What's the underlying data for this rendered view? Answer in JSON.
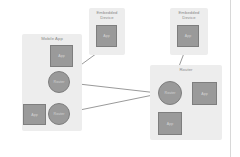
{
  "diagram": {
    "colors": {
      "canvas": "#ffffff",
      "group_fill": "#ededed",
      "node_fill": "#9a9a9a",
      "node_stroke": "#7e7e7e",
      "node_text": "#d5d5d5",
      "group_text": "#8a8a8a",
      "edge": "#9a9a9a",
      "divider": "#d8d8d8"
    },
    "groups": [
      {
        "id": "mobile-app",
        "label": "Mobile App",
        "x": 22,
        "y": 34,
        "w": 60,
        "h": 97
      },
      {
        "id": "embedded-device-top-center",
        "label": "Embedded\nDevice",
        "x": 89,
        "y": 8,
        "w": 36,
        "h": 47
      },
      {
        "id": "embedded-device-top-right",
        "label": "Embedded\nDevice",
        "x": 170,
        "y": 8,
        "w": 38,
        "h": 47
      },
      {
        "id": "router-group",
        "label": "Router",
        "x": 150,
        "y": 65,
        "w": 72,
        "h": 75
      }
    ],
    "nodes": [
      {
        "id": "app-mobile-top",
        "type": "box",
        "label": "App",
        "x": 50,
        "y": 45,
        "w": 23,
        "h": 22
      },
      {
        "id": "router-mobile-1",
        "type": "circle",
        "label": "Router",
        "cx": 59,
        "cy": 82,
        "r": 11
      },
      {
        "id": "router-mobile-2",
        "type": "circle",
        "label": "Router",
        "cx": 59,
        "cy": 114,
        "r": 11
      },
      {
        "id": "app-mobile-left",
        "type": "box",
        "label": "App",
        "x": 23,
        "y": 104,
        "w": 23,
        "h": 21
      },
      {
        "id": "app-embedded-1",
        "type": "box",
        "label": "App",
        "x": 96,
        "y": 25,
        "w": 21,
        "h": 22
      },
      {
        "id": "app-embedded-2",
        "type": "box",
        "label": "App",
        "x": 177,
        "y": 25,
        "w": 22,
        "h": 22
      },
      {
        "id": "router-main",
        "type": "circle",
        "label": "Router",
        "cx": 170,
        "cy": 93,
        "r": 12
      },
      {
        "id": "app-router-right",
        "type": "box",
        "label": "App",
        "x": 192,
        "y": 82,
        "w": 25,
        "h": 23
      },
      {
        "id": "app-router-bottom",
        "type": "box",
        "label": "App",
        "x": 158,
        "y": 112,
        "w": 24,
        "h": 23
      }
    ],
    "edges": [
      {
        "id": "edge-app-mobile-top--router-mobile-1",
        "from": "app-mobile-top",
        "to": "router-mobile-1",
        "x1": 60,
        "y1": 67,
        "x2": 59,
        "y2": 73
      },
      {
        "id": "edge-router-mobile-1--router-mobile-2",
        "from": "router-mobile-1",
        "to": "router-mobile-2",
        "x1": 59,
        "y1": 93,
        "x2": 59,
        "y2": 103
      },
      {
        "id": "edge-router-mobile-2--app-mobile-left",
        "from": "router-mobile-2",
        "to": "app-mobile-left",
        "x1": 48,
        "y1": 114,
        "x2": 46,
        "y2": 114
      },
      {
        "id": "edge-router-mobile-1--app-embedded-1",
        "from": "router-mobile-1",
        "to": "app-embedded-1",
        "x1": 67,
        "y1": 75,
        "x2": 104,
        "y2": 48
      },
      {
        "id": "edge-router-mobile-1--router-main",
        "from": "router-mobile-1",
        "to": "router-main",
        "x1": 70,
        "y1": 83,
        "x2": 158,
        "y2": 93
      },
      {
        "id": "edge-router-mobile-2--router-main",
        "from": "router-mobile-2",
        "to": "router-main",
        "x1": 70,
        "y1": 112,
        "x2": 158,
        "y2": 94
      },
      {
        "id": "edge-app-embedded-2--router-main",
        "from": "app-embedded-2",
        "to": "router-main",
        "x1": 186,
        "y1": 48,
        "x2": 173,
        "y2": 82
      },
      {
        "id": "edge-router-main--app-router-right",
        "from": "router-main",
        "to": "app-router-right",
        "x1": 182,
        "y1": 93,
        "x2": 192,
        "y2": 93
      },
      {
        "id": "edge-router-main--app-router-bottom",
        "from": "router-main",
        "to": "app-router-bottom",
        "x1": 170,
        "y1": 105,
        "x2": 170,
        "y2": 112
      }
    ]
  }
}
